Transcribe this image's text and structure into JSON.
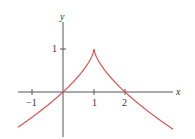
{
  "chart_data": {
    "type": "line",
    "title": "",
    "xlabel": "x",
    "ylabel": "y",
    "function": "y = 1 - |x - 1|^(2/3)",
    "xlim": [
      -1.45,
      3.55
    ],
    "ylim": [
      -1.0,
      1.6
    ],
    "grid": false,
    "legend": null,
    "x_ticks": [
      {
        "value": -1,
        "label": "-1"
      },
      {
        "value": 1,
        "label": "1"
      },
      {
        "value": 2,
        "label": "2"
      }
    ],
    "y_ticks": [
      {
        "value": 1,
        "label": "1"
      }
    ],
    "annotations": [
      {
        "type": "cusp",
        "x": 1,
        "y": 1
      }
    ],
    "series": [
      {
        "name": "f(x)",
        "color": "#d9534f",
        "x": [
          -1.45,
          -1.0,
          -0.5,
          0.0,
          0.5,
          0.9,
          1.0,
          1.1,
          1.5,
          2.0,
          2.5,
          3.0,
          3.55
        ],
        "values": [
          -0.82,
          -0.59,
          -0.31,
          0.0,
          0.37,
          0.78,
          1.0,
          0.78,
          0.37,
          0.0,
          -0.31,
          -0.59,
          -0.87
        ]
      }
    ]
  },
  "labels": {
    "x_axis": "x",
    "y_axis": "y",
    "tick_neg1": "−1",
    "tick_1": "1",
    "tick_2": "2",
    "ytick_1": "1"
  },
  "colors": {
    "curve": "#d9534f",
    "axis": "#555555"
  }
}
